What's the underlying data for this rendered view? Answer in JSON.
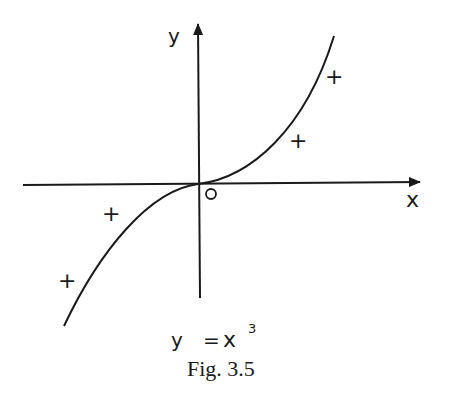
{
  "figure": {
    "caption": "Fig. 3.5",
    "equation": {
      "lhs": "y",
      "eq": "=",
      "base": "x",
      "exponent": "3"
    },
    "axes": {
      "x_label": "x",
      "y_label": "y",
      "origin_label": "O"
    },
    "curve": {
      "function": "y = x^3",
      "description": "cubic curve through origin"
    },
    "sign_markers": {
      "upper_right": [
        "+",
        "+"
      ],
      "lower_left": [
        "+",
        "+"
      ]
    },
    "colors": {
      "ink": "#1a1a1a",
      "background": "#ffffff"
    }
  }
}
